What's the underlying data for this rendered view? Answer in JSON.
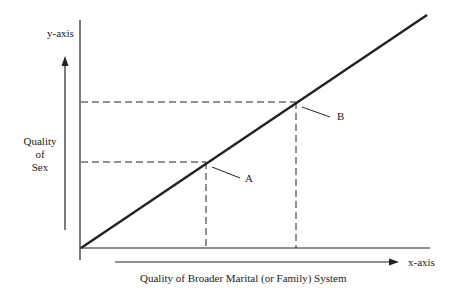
{
  "diagram": {
    "y_axis_label": "y-axis",
    "x_axis_label": "x-axis",
    "y_title": [
      "Quality",
      "of",
      "Sex"
    ],
    "x_title": "Quality of Broader Marital (or Family) System",
    "points": [
      {
        "label": "A"
      },
      {
        "label": "B"
      }
    ],
    "colors": {
      "line": "#222222",
      "background": "#ffffff"
    }
  }
}
